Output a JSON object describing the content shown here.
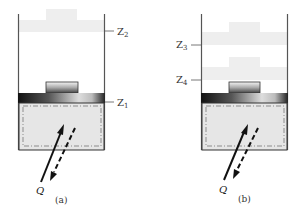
{
  "figure": {
    "panels": [
      {
        "id": "a",
        "caption": "(a)",
        "heat_label": "Q",
        "levels": [
          {
            "name": "Z",
            "sub": "2",
            "role": "upper weight position"
          },
          {
            "name": "Z",
            "sub": "1",
            "role": "piston position"
          }
        ],
        "weights": 1
      },
      {
        "id": "b",
        "caption": "(b)",
        "heat_label": "Q",
        "levels": [
          {
            "name": "Z",
            "sub": "3",
            "role": "upper weight position"
          },
          {
            "name": "Z",
            "sub": "4",
            "role": "lower weight position"
          }
        ],
        "weights": 2
      }
    ],
    "colors": {
      "wall": "#555555",
      "weight": "#eeeeee",
      "gas": "#e6e6e6",
      "piston_dark": "#1a1a1a",
      "piston_light": "#d0d0d0",
      "arrow": "#111111"
    }
  }
}
